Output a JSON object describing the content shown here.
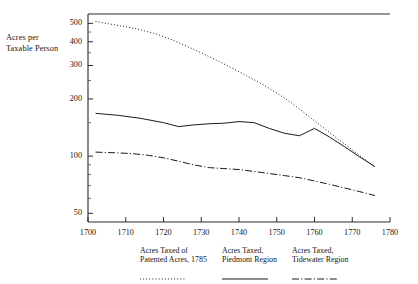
{
  "axis": {
    "y_caption_line1": "Acres per",
    "y_caption_line2": "Taxable Person",
    "y_ticks": [
      50,
      100,
      200,
      300,
      400,
      500
    ],
    "x_ticks": [
      1700,
      1710,
      1720,
      1730,
      1740,
      1750,
      1760,
      1770,
      1780
    ]
  },
  "legend": [
    {
      "line1": "Acres Taxed of",
      "line2": "Patented Acres, 1785",
      "style": "dotted"
    },
    {
      "line1": "Acres Taxed,",
      "line2": "Piedmont Region",
      "style": "solid"
    },
    {
      "line1": "Acres Taxed,",
      "line2": "Tidewater Region",
      "style": "dashdot"
    }
  ],
  "chart_data": {
    "type": "line",
    "title": "",
    "xlabel": "",
    "ylabel": "Acres per Taxable Person",
    "yscale": "log",
    "ylim": [
      45,
      560
    ],
    "xlim": [
      1700,
      1780
    ],
    "ytick_values": [
      50,
      100,
      200,
      300,
      400,
      500
    ],
    "xtick_values": [
      1700,
      1710,
      1720,
      1730,
      1740,
      1750,
      1760,
      1770,
      1780
    ],
    "grid": false,
    "legend_position": "below",
    "series": [
      {
        "name": "Acres Taxed of Patented Acres, 1785",
        "style": "dotted",
        "color": "#1a1a1a",
        "x": [
          1702,
          1706,
          1710,
          1714,
          1718,
          1722,
          1726,
          1730,
          1734,
          1738,
          1742,
          1746,
          1750,
          1754,
          1758,
          1762,
          1766,
          1770,
          1774,
          1776
        ],
        "y": [
          512,
          495,
          480,
          462,
          440,
          412,
          380,
          350,
          320,
          292,
          265,
          240,
          215,
          190,
          165,
          143,
          124,
          108,
          94,
          88
        ]
      },
      {
        "name": "Acres Taxed, Piedmont Region",
        "style": "solid",
        "color": "#1a1a1a",
        "x": [
          1702,
          1708,
          1714,
          1720,
          1724,
          1728,
          1732,
          1736,
          1740,
          1744,
          1748,
          1752,
          1756,
          1760,
          1764,
          1768,
          1772,
          1776
        ],
        "y": [
          168,
          164,
          158,
          150,
          143,
          146,
          148,
          149,
          152,
          150,
          140,
          132,
          128,
          140,
          126,
          112,
          99,
          88
        ]
      },
      {
        "name": "Acres Taxed, Tidewater Region",
        "style": "dashdot",
        "color": "#1a1a1a",
        "x": [
          1702,
          1708,
          1712,
          1716,
          1720,
          1724,
          1728,
          1732,
          1736,
          1740,
          1744,
          1748,
          1752,
          1756,
          1760,
          1764,
          1768,
          1772,
          1776
        ],
        "y": [
          105,
          104,
          103,
          101,
          98,
          94,
          90,
          87,
          86,
          85,
          83,
          81,
          79,
          77,
          74,
          71,
          68,
          65,
          62
        ]
      }
    ]
  }
}
